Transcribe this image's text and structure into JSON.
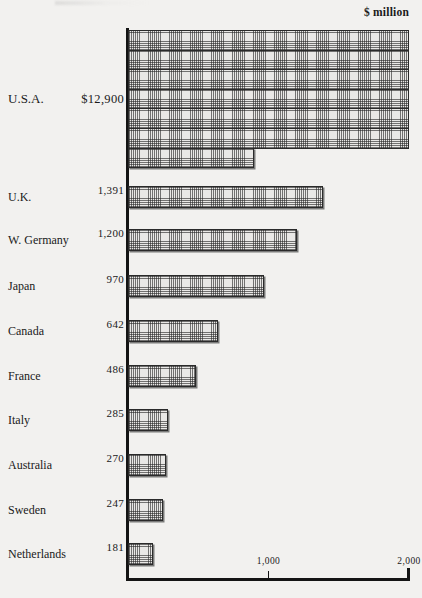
{
  "chart_data": {
    "type": "bar",
    "orientation": "horizontal",
    "title": "",
    "unit_caption": "$ million",
    "xlabel": "",
    "ylabel": "",
    "xlim": [
      0,
      2000
    ],
    "wrap_value": 2000,
    "grid": false,
    "legend": null,
    "axis_ticks": [
      {
        "value": 1000,
        "label": "1,000"
      },
      {
        "value": 2000,
        "label": "2,000"
      }
    ],
    "categories": [
      "U.S.A.",
      "U.K.",
      "W. Germany",
      "Japan",
      "Canada",
      "France",
      "Italy",
      "Australia",
      "Sweden",
      "Netherlands"
    ],
    "values": [
      12900,
      1391,
      1200,
      970,
      642,
      486,
      285,
      270,
      247,
      181
    ],
    "value_labels": [
      "$12,900",
      "1,391",
      "1,200",
      "970",
      "642",
      "486",
      "285",
      "270",
      "247",
      "181"
    ]
  },
  "bars": [
    {
      "name": "U.S.A.",
      "label": "U.S.A.",
      "value_label": "$12,900",
      "value": 12900,
      "wrapped": true,
      "rows": 7,
      "top": 30,
      "row_height": 19.6,
      "last_row_width_value": 900
    },
    {
      "name": "U.K.",
      "label": "U.K.",
      "value_label": "1,391",
      "value": 1391,
      "wrapped": false,
      "top": 186,
      "height": 22
    },
    {
      "name": "W. Germany",
      "label": "W. Germany",
      "value_label": "1,200",
      "value": 1200,
      "wrapped": false,
      "top": 229,
      "height": 22
    },
    {
      "name": "Japan",
      "label": "Japan",
      "value_label": "970",
      "value": 970,
      "wrapped": false,
      "top": 275,
      "height": 22
    },
    {
      "name": "Canada",
      "label": "Canada",
      "value_label": "642",
      "value": 642,
      "wrapped": false,
      "top": 320,
      "height": 22
    },
    {
      "name": "France",
      "label": "France",
      "value_label": "486",
      "value": 486,
      "wrapped": false,
      "top": 365,
      "height": 22
    },
    {
      "name": "Italy",
      "label": "Italy",
      "value_label": "285",
      "value": 285,
      "wrapped": false,
      "top": 409,
      "height": 22
    },
    {
      "name": "Australia",
      "label": "Australia",
      "value_label": "270",
      "value": 270,
      "wrapped": false,
      "top": 454,
      "height": 22
    },
    {
      "name": "Sweden",
      "label": "Sweden",
      "value_label": "247",
      "value": 247,
      "wrapped": false,
      "top": 499,
      "height": 22
    },
    {
      "name": "Netherlands",
      "label": "Netherlands",
      "value_label": "181",
      "value": 181,
      "wrapped": false,
      "top": 543,
      "height": 22
    }
  ],
  "colors": {
    "background": "#f2f1ef",
    "ink": "#141414",
    "bar_fill": "#e9e8e6",
    "bar_hatch": "#282828",
    "bar_border": "#2a2a2a"
  }
}
